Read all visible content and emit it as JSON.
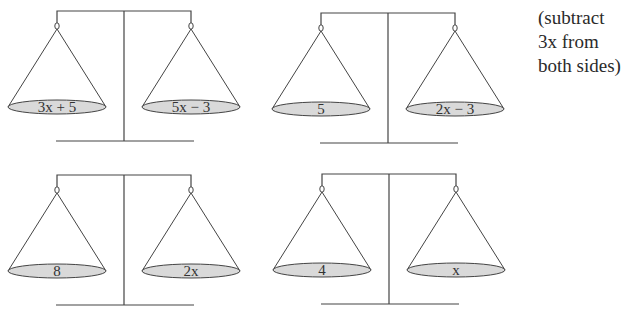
{
  "diagram": {
    "type": "balance-scale-equation-steps",
    "scales": [
      {
        "id": "scale-1",
        "left": "3x + 5",
        "right": "5x − 3"
      },
      {
        "id": "scale-2",
        "left": "5",
        "right": "2x − 3"
      },
      {
        "id": "scale-3",
        "left": "8",
        "right": "2x"
      },
      {
        "id": "scale-4",
        "left": "4",
        "right": "x"
      }
    ],
    "annotation": {
      "lines": [
        "(subtract",
        "3x from",
        "both sides)"
      ]
    }
  },
  "colors": {
    "line": "#444444",
    "pan_fill": "#d9d9d9",
    "text": "#333333"
  }
}
